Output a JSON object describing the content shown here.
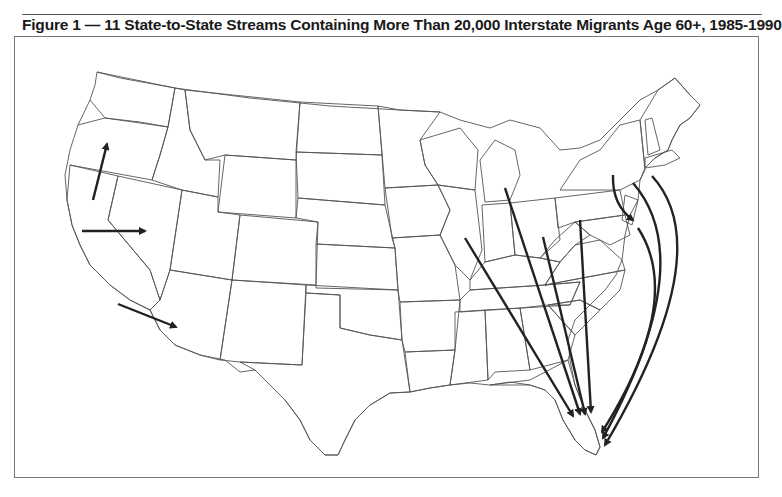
{
  "figure": {
    "title": "Figure 1 — 11 State-to-State Streams Containing More Than 20,000 Interstate Migrants Age 60+, 1985-1990"
  },
  "map": {
    "region": "Contiguous United States",
    "stream_count": 11,
    "threshold": "20,000",
    "age_group": "60+",
    "period": "1985-1990",
    "colors": {
      "outline": "#555555",
      "arrow": "#222222",
      "frame": "#777777"
    },
    "streams": [
      {
        "from": "California",
        "to": "Oregon"
      },
      {
        "from": "California",
        "to": "Nevada"
      },
      {
        "from": "California",
        "to": "Arizona"
      },
      {
        "from": "Illinois",
        "to": "Florida"
      },
      {
        "from": "Michigan",
        "to": "Florida"
      },
      {
        "from": "Ohio",
        "to": "Florida"
      },
      {
        "from": "Pennsylvania",
        "to": "Florida"
      },
      {
        "from": "New York",
        "to": "New Jersey"
      },
      {
        "from": "New York",
        "to": "Florida"
      },
      {
        "from": "New Jersey",
        "to": "Florida"
      },
      {
        "from": "Massachusetts",
        "to": "Florida"
      }
    ]
  }
}
